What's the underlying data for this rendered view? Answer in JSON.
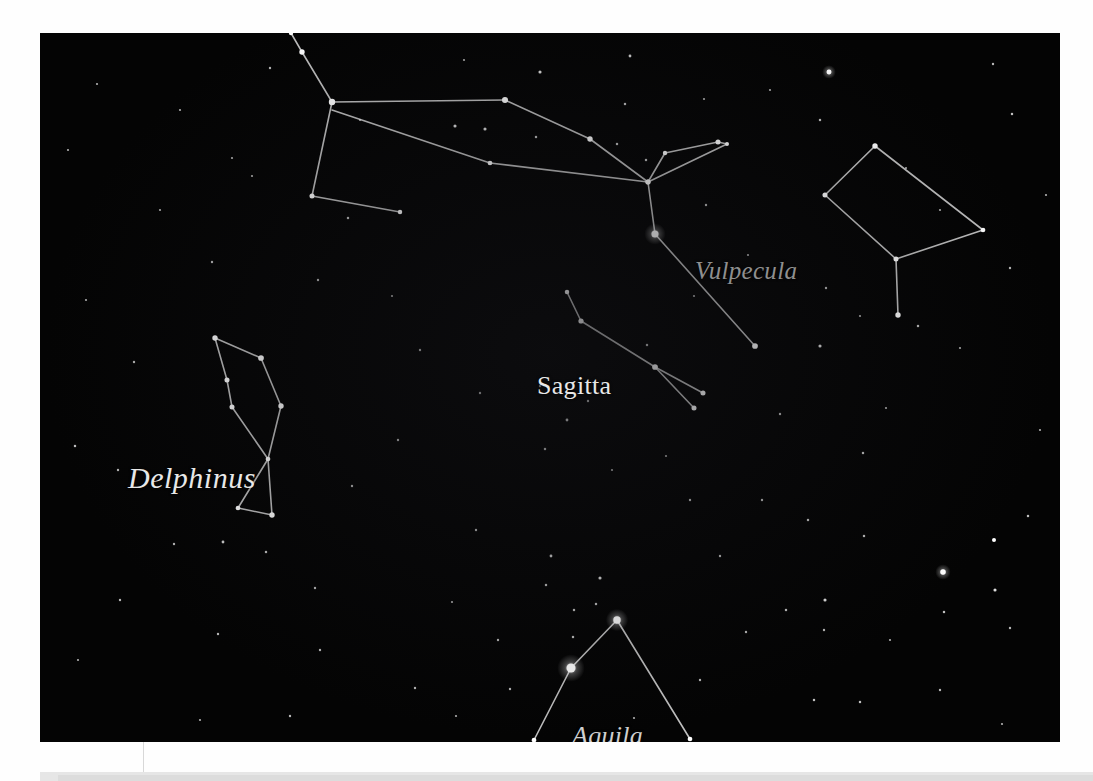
{
  "page": {
    "background_color": "#fefefe",
    "plate_color": "#040404",
    "plate": {
      "x": 40,
      "y": 33,
      "width": 1020,
      "height": 709
    }
  },
  "chart_data": {
    "type": "scatter",
    "title": "",
    "subtitle": "",
    "xlabel": "",
    "ylabel": "",
    "grid": false,
    "legend_position": "none",
    "labels": [
      {
        "name": "Delphinus",
        "text": "Delphinus",
        "style": "italic",
        "x": 88,
        "y": 428,
        "font_size": 30,
        "color": "#e8e8e8"
      },
      {
        "name": "Sagitta",
        "text": "Sagitta",
        "style": "roman",
        "x": 497,
        "y": 338,
        "font_size": 26,
        "color": "#e8e8e8"
      },
      {
        "name": "Vulpecula",
        "text": "Vulpecula",
        "style": "italic",
        "x": 655,
        "y": 224,
        "font_size": 25,
        "color": "#8f8f8f"
      },
      {
        "name": "Aquila",
        "text": "Aquila",
        "style": "italic",
        "x": 532,
        "y": 688,
        "font_size": 26,
        "color": "#cfcfcf"
      }
    ],
    "line_color": "#d9d9d9",
    "line_width": 1.6,
    "star_color": "#ffffff",
    "constellations": [
      {
        "name": "Cygnus",
        "label_shown": false,
        "stars": [
          {
            "x": 291,
            "y": 33,
            "mag": 1.4
          },
          {
            "x": 302,
            "y": 52,
            "mag": 2.0
          },
          {
            "x": 332,
            "y": 102,
            "mag": 2.6
          },
          {
            "x": 312,
            "y": 196,
            "mag": 1.8
          },
          {
            "x": 400,
            "y": 212,
            "mag": 1.5
          },
          {
            "x": 505,
            "y": 100,
            "mag": 2.4
          },
          {
            "x": 590,
            "y": 139,
            "mag": 2.0
          },
          {
            "x": 648,
            "y": 182,
            "mag": 1.8
          },
          {
            "x": 490,
            "y": 163,
            "mag": 1.6
          },
          {
            "x": 655,
            "y": 234,
            "mag": 3.0
          },
          {
            "x": 755,
            "y": 346,
            "mag": 2.2
          }
        ],
        "lines": [
          [
            291,
            33,
            302,
            52
          ],
          [
            302,
            52,
            332,
            102
          ],
          [
            332,
            102,
            505,
            100
          ],
          [
            505,
            100,
            590,
            139
          ],
          [
            590,
            139,
            648,
            182
          ],
          [
            332,
            102,
            312,
            196
          ],
          [
            312,
            196,
            400,
            212
          ],
          [
            332,
            110,
            490,
            163
          ],
          [
            490,
            163,
            648,
            182
          ],
          [
            648,
            182,
            655,
            234
          ],
          [
            655,
            234,
            755,
            346
          ]
        ]
      },
      {
        "name": "Vulpecula",
        "label_shown": true,
        "stars": [
          {
            "x": 665,
            "y": 153,
            "mag": 1.4
          },
          {
            "x": 718,
            "y": 142,
            "mag": 1.8
          },
          {
            "x": 727,
            "y": 144,
            "mag": 1.2
          },
          {
            "x": 648,
            "y": 182,
            "mag": 1.8
          }
        ],
        "lines": [
          [
            648,
            182,
            665,
            153
          ],
          [
            665,
            153,
            718,
            142
          ],
          [
            718,
            142,
            727,
            144
          ],
          [
            727,
            144,
            648,
            182
          ]
        ]
      },
      {
        "name": "Sagitta",
        "label_shown": true,
        "stars": [
          {
            "x": 567,
            "y": 292,
            "mag": 1.5
          },
          {
            "x": 581,
            "y": 321,
            "mag": 1.9
          },
          {
            "x": 655,
            "y": 367,
            "mag": 2.2
          },
          {
            "x": 703,
            "y": 393,
            "mag": 1.8
          },
          {
            "x": 694,
            "y": 408,
            "mag": 1.8
          }
        ],
        "lines": [
          [
            567,
            292,
            581,
            321
          ],
          [
            581,
            321,
            655,
            367
          ],
          [
            655,
            367,
            703,
            393
          ],
          [
            655,
            367,
            694,
            408
          ]
        ]
      },
      {
        "name": "Delphinus",
        "label_shown": true,
        "stars": [
          {
            "x": 215,
            "y": 338,
            "mag": 2.0
          },
          {
            "x": 261,
            "y": 358,
            "mag": 2.2
          },
          {
            "x": 281,
            "y": 406,
            "mag": 2.0
          },
          {
            "x": 227,
            "y": 380,
            "mag": 1.8
          },
          {
            "x": 232,
            "y": 407,
            "mag": 1.8
          },
          {
            "x": 268,
            "y": 459,
            "mag": 1.6
          },
          {
            "x": 238,
            "y": 508,
            "mag": 1.6
          },
          {
            "x": 272,
            "y": 515,
            "mag": 2.0
          }
        ],
        "lines": [
          [
            215,
            338,
            261,
            358
          ],
          [
            261,
            358,
            281,
            406
          ],
          [
            215,
            338,
            227,
            380
          ],
          [
            227,
            380,
            232,
            407
          ],
          [
            232,
            407,
            268,
            459
          ],
          [
            281,
            406,
            268,
            459
          ],
          [
            268,
            459,
            238,
            508
          ],
          [
            238,
            508,
            272,
            515
          ],
          [
            272,
            515,
            268,
            459
          ]
        ]
      },
      {
        "name": "Pegasus-Equuleus",
        "label_shown": false,
        "stars": [
          {
            "x": 875,
            "y": 146,
            "mag": 2.0
          },
          {
            "x": 983,
            "y": 230,
            "mag": 1.6
          },
          {
            "x": 896,
            "y": 259,
            "mag": 1.8
          },
          {
            "x": 825,
            "y": 195,
            "mag": 1.8
          },
          {
            "x": 898,
            "y": 315,
            "mag": 2.0
          }
        ],
        "lines": [
          [
            875,
            146,
            983,
            230
          ],
          [
            983,
            230,
            896,
            259
          ],
          [
            896,
            259,
            825,
            195
          ],
          [
            825,
            195,
            875,
            146
          ],
          [
            896,
            259,
            898,
            315
          ]
        ]
      },
      {
        "name": "Aquila",
        "label_shown": true,
        "stars": [
          {
            "x": 617,
            "y": 620,
            "mag": 3.2
          },
          {
            "x": 571,
            "y": 668,
            "mag": 4.2
          },
          {
            "x": 534,
            "y": 740,
            "mag": 1.6
          },
          {
            "x": 690,
            "y": 739,
            "mag": 1.6
          }
        ],
        "lines": [
          [
            617,
            620,
            571,
            668
          ],
          [
            571,
            668,
            534,
            740
          ],
          [
            617,
            620,
            690,
            739
          ]
        ]
      }
    ],
    "background_stars": [
      {
        "x": 829,
        "y": 72,
        "mag": 2.6
      },
      {
        "x": 540,
        "y": 72,
        "mag": 1.4
      },
      {
        "x": 630,
        "y": 56,
        "mag": 1.2
      },
      {
        "x": 455,
        "y": 126,
        "mag": 1.4
      },
      {
        "x": 485,
        "y": 129,
        "mag": 1.4
      },
      {
        "x": 536,
        "y": 137,
        "mag": 1.0
      },
      {
        "x": 625,
        "y": 104,
        "mag": 1.0
      },
      {
        "x": 270,
        "y": 68,
        "mag": 0.9
      },
      {
        "x": 97,
        "y": 84,
        "mag": 0.8
      },
      {
        "x": 180,
        "y": 110,
        "mag": 0.8
      },
      {
        "x": 232,
        "y": 158,
        "mag": 0.8
      },
      {
        "x": 348,
        "y": 218,
        "mag": 1.0
      },
      {
        "x": 617,
        "y": 144,
        "mag": 1.0
      },
      {
        "x": 646,
        "y": 160,
        "mag": 1.0
      },
      {
        "x": 820,
        "y": 120,
        "mag": 1.0
      },
      {
        "x": 1012,
        "y": 114,
        "mag": 1.0
      },
      {
        "x": 993,
        "y": 64,
        "mag": 0.9
      },
      {
        "x": 1046,
        "y": 195,
        "mag": 0.8
      },
      {
        "x": 770,
        "y": 90,
        "mag": 0.8
      },
      {
        "x": 704,
        "y": 99,
        "mag": 0.8
      },
      {
        "x": 706,
        "y": 205,
        "mag": 0.9
      },
      {
        "x": 826,
        "y": 288,
        "mag": 0.9
      },
      {
        "x": 860,
        "y": 316,
        "mag": 0.8
      },
      {
        "x": 940,
        "y": 210,
        "mag": 0.8
      },
      {
        "x": 1010,
        "y": 268,
        "mag": 0.9
      },
      {
        "x": 918,
        "y": 326,
        "mag": 1.0
      },
      {
        "x": 820,
        "y": 346,
        "mag": 1.4
      },
      {
        "x": 780,
        "y": 414,
        "mag": 0.9
      },
      {
        "x": 863,
        "y": 453,
        "mag": 1.0
      },
      {
        "x": 762,
        "y": 500,
        "mag": 0.9
      },
      {
        "x": 808,
        "y": 520,
        "mag": 1.0
      },
      {
        "x": 864,
        "y": 536,
        "mag": 1.0
      },
      {
        "x": 943,
        "y": 572,
        "mag": 3.0
      },
      {
        "x": 994,
        "y": 540,
        "mag": 2.0
      },
      {
        "x": 995,
        "y": 590,
        "mag": 1.4
      },
      {
        "x": 944,
        "y": 612,
        "mag": 1.0
      },
      {
        "x": 1028,
        "y": 516,
        "mag": 1.0
      },
      {
        "x": 825,
        "y": 600,
        "mag": 1.4
      },
      {
        "x": 786,
        "y": 610,
        "mag": 1.0
      },
      {
        "x": 824,
        "y": 630,
        "mag": 0.9
      },
      {
        "x": 814,
        "y": 700,
        "mag": 1.0
      },
      {
        "x": 860,
        "y": 702,
        "mag": 1.0
      },
      {
        "x": 1010,
        "y": 628,
        "mag": 0.9
      },
      {
        "x": 940,
        "y": 690,
        "mag": 0.9
      },
      {
        "x": 720,
        "y": 556,
        "mag": 0.9
      },
      {
        "x": 690,
        "y": 500,
        "mag": 0.9
      },
      {
        "x": 600,
        "y": 578,
        "mag": 1.4
      },
      {
        "x": 551,
        "y": 556,
        "mag": 1.2
      },
      {
        "x": 546,
        "y": 585,
        "mag": 1.0
      },
      {
        "x": 476,
        "y": 530,
        "mag": 0.9
      },
      {
        "x": 545,
        "y": 449,
        "mag": 1.0
      },
      {
        "x": 567,
        "y": 420,
        "mag": 1.2
      },
      {
        "x": 588,
        "y": 401,
        "mag": 0.9
      },
      {
        "x": 647,
        "y": 345,
        "mag": 1.0
      },
      {
        "x": 540,
        "y": 386,
        "mag": 0.9
      },
      {
        "x": 480,
        "y": 393,
        "mag": 0.9
      },
      {
        "x": 420,
        "y": 350,
        "mag": 0.9
      },
      {
        "x": 398,
        "y": 440,
        "mag": 0.9
      },
      {
        "x": 318,
        "y": 280,
        "mag": 0.9
      },
      {
        "x": 212,
        "y": 262,
        "mag": 0.9
      },
      {
        "x": 134,
        "y": 362,
        "mag": 0.9
      },
      {
        "x": 75,
        "y": 446,
        "mag": 1.0
      },
      {
        "x": 118,
        "y": 470,
        "mag": 0.9
      },
      {
        "x": 174,
        "y": 544,
        "mag": 0.9
      },
      {
        "x": 223,
        "y": 542,
        "mag": 1.2
      },
      {
        "x": 266,
        "y": 552,
        "mag": 1.0
      },
      {
        "x": 315,
        "y": 588,
        "mag": 0.9
      },
      {
        "x": 120,
        "y": 600,
        "mag": 0.9
      },
      {
        "x": 218,
        "y": 634,
        "mag": 0.9
      },
      {
        "x": 320,
        "y": 650,
        "mag": 0.9
      },
      {
        "x": 290,
        "y": 716,
        "mag": 0.9
      },
      {
        "x": 415,
        "y": 688,
        "mag": 0.9
      },
      {
        "x": 456,
        "y": 716,
        "mag": 0.8
      },
      {
        "x": 498,
        "y": 640,
        "mag": 0.9
      },
      {
        "x": 574,
        "y": 610,
        "mag": 1.0
      },
      {
        "x": 596,
        "y": 604,
        "mag": 1.0
      },
      {
        "x": 573,
        "y": 637,
        "mag": 1.0
      },
      {
        "x": 510,
        "y": 689,
        "mag": 0.9
      },
      {
        "x": 746,
        "y": 632,
        "mag": 0.9
      },
      {
        "x": 700,
        "y": 680,
        "mag": 0.9
      },
      {
        "x": 634,
        "y": 718,
        "mag": 0.8
      },
      {
        "x": 352,
        "y": 486,
        "mag": 0.9
      },
      {
        "x": 392,
        "y": 296,
        "mag": 0.8
      },
      {
        "x": 252,
        "y": 176,
        "mag": 0.8
      },
      {
        "x": 160,
        "y": 210,
        "mag": 0.8
      },
      {
        "x": 86,
        "y": 300,
        "mag": 0.8
      },
      {
        "x": 68,
        "y": 150,
        "mag": 0.8
      },
      {
        "x": 464,
        "y": 60,
        "mag": 0.8
      },
      {
        "x": 360,
        "y": 120,
        "mag": 0.8
      },
      {
        "x": 694,
        "y": 296,
        "mag": 0.8
      },
      {
        "x": 748,
        "y": 255,
        "mag": 0.8
      },
      {
        "x": 886,
        "y": 408,
        "mag": 0.8
      },
      {
        "x": 906,
        "y": 168,
        "mag": 0.8
      },
      {
        "x": 960,
        "y": 348,
        "mag": 0.8
      },
      {
        "x": 1040,
        "y": 430,
        "mag": 0.8
      },
      {
        "x": 666,
        "y": 456,
        "mag": 0.8
      },
      {
        "x": 612,
        "y": 470,
        "mag": 0.8
      },
      {
        "x": 452,
        "y": 602,
        "mag": 0.8
      },
      {
        "x": 200,
        "y": 720,
        "mag": 0.8
      },
      {
        "x": 78,
        "y": 660,
        "mag": 0.8
      },
      {
        "x": 1002,
        "y": 724,
        "mag": 0.8
      },
      {
        "x": 890,
        "y": 640,
        "mag": 0.8
      }
    ]
  }
}
